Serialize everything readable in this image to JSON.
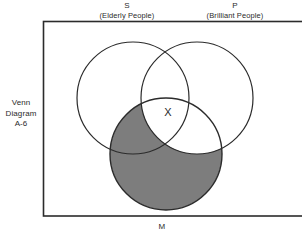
{
  "figure": {
    "caption_line1": "Venn",
    "caption_line2": "Diagram",
    "caption_line3": "A-6",
    "x_marker": "X"
  },
  "sets": {
    "s": {
      "letter": "S",
      "gloss": "(Elderly People)"
    },
    "p": {
      "letter": "P",
      "gloss": "(Brilliant People)"
    },
    "m": {
      "letter": "M",
      "gloss": ""
    }
  },
  "colors": {
    "stroke": "#2b2b2b",
    "shade": "#7d7d7d",
    "background": "#ffffff",
    "text": "#2b2b2b"
  },
  "geometry": {
    "universe_rect": {
      "x": 43,
      "y": 21,
      "width": 259,
      "height": 195
    },
    "circle_s": {
      "cx": 133,
      "cy": 98,
      "r": 56
    },
    "circle_p": {
      "cx": 197,
      "cy": 98,
      "r": 56
    },
    "circle_m": {
      "cx": 166,
      "cy": 154,
      "r": 56
    },
    "shaded_region": "M minus P"
  }
}
